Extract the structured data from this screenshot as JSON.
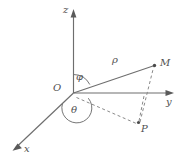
{
  "figure": {
    "background_color": "#ffffff",
    "line_color": "#6e6e6e",
    "dash_color": "#8a8a8a",
    "label_color": "#4f4f4f",
    "width": 184,
    "height": 164
  },
  "axes": [
    {
      "name": "z",
      "label": "z",
      "direction": "up"
    },
    {
      "name": "y",
      "label": "y",
      "direction": "right"
    },
    {
      "name": "x",
      "label": "x",
      "direction": "down-left"
    }
  ],
  "labels": {
    "z_axis": "z",
    "y_axis": "y",
    "x_axis": "x",
    "origin": "O",
    "point_m": "M",
    "point_p": "P",
    "radius": "ρ",
    "polar_angle": "φ",
    "azimuth_angle": "θ"
  },
  "points": [
    {
      "name": "origin",
      "label": "O"
    },
    {
      "name": "point-m",
      "label": "M"
    },
    {
      "name": "point-p",
      "label": "P"
    }
  ],
  "segments": [
    {
      "name": "radius-om",
      "label": "ρ",
      "style": "solid"
    },
    {
      "name": "projection-op",
      "label": "",
      "style": "dashed"
    },
    {
      "name": "vertical-pm",
      "label": "",
      "style": "dashed"
    },
    {
      "name": "p-to-y-axis",
      "label": "",
      "style": "dashed"
    }
  ],
  "angles": [
    {
      "name": "phi",
      "label": "φ",
      "between": "z-axis and OM"
    },
    {
      "name": "theta",
      "label": "θ",
      "between": "x-axis and OP"
    }
  ]
}
